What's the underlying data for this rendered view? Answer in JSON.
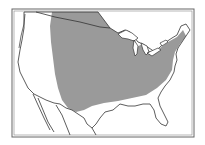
{
  "map": {
    "title": "",
    "region_shown": "Contiguous United States",
    "shaded_region_label": "",
    "colors": {
      "background": "#ffffff",
      "land": "#ffffff",
      "shaded_range": "#9a9a9a",
      "outline": "#333333",
      "frame": "#555555"
    }
  }
}
